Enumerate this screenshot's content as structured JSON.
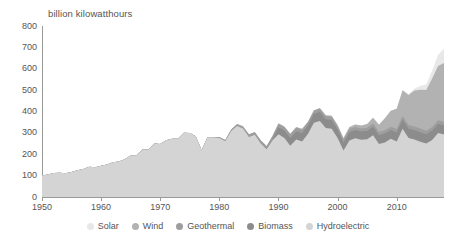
{
  "axis_title": "billion kilowatthours",
  "legend": {
    "items": [
      {
        "label": "Solar",
        "color": "#e8e8e8"
      },
      {
        "label": "Wind",
        "color": "#b2b2b2"
      },
      {
        "label": "Geothermal",
        "color": "#9e9e9e"
      },
      {
        "label": "Biomass",
        "color": "#8c8c8c"
      },
      {
        "label": "Hydroelectric",
        "color": "#d4d4d4"
      }
    ]
  },
  "chart_data": {
    "type": "area",
    "title": "",
    "subtitle": "",
    "xlabel": "",
    "ylabel": "billion kilowatthours",
    "stacked": true,
    "grid": false,
    "legend_position": "bottom",
    "xlim": [
      1950,
      2018
    ],
    "ylim": [
      0,
      800
    ],
    "yticks": [
      0,
      100,
      200,
      300,
      400,
      500,
      600,
      700,
      800
    ],
    "xticks": [
      1950,
      1960,
      1970,
      1980,
      1990,
      2000,
      2010
    ],
    "x": [
      1950,
      1951,
      1952,
      1953,
      1954,
      1955,
      1956,
      1957,
      1958,
      1959,
      1960,
      1961,
      1962,
      1963,
      1964,
      1965,
      1966,
      1967,
      1968,
      1969,
      1970,
      1971,
      1972,
      1973,
      1974,
      1975,
      1976,
      1977,
      1978,
      1979,
      1980,
      1981,
      1982,
      1983,
      1984,
      1985,
      1986,
      1987,
      1988,
      1989,
      1990,
      1991,
      1992,
      1993,
      1994,
      1995,
      1996,
      1997,
      1998,
      1999,
      2000,
      2001,
      2002,
      2003,
      2004,
      2005,
      2006,
      2007,
      2008,
      2009,
      2010,
      2011,
      2012,
      2013,
      2014,
      2015,
      2016,
      2017,
      2018
    ],
    "series": [
      {
        "name": "Hydroelectric",
        "color": "#d4d4d4",
        "values": [
          101,
          105,
          112,
          114,
          111,
          117,
          125,
          131,
          141,
          139,
          146,
          152,
          163,
          166,
          177,
          194,
          195,
          222,
          222,
          250,
          248,
          266,
          273,
          272,
          301,
          300,
          284,
          220,
          280,
          280,
          276,
          261,
          309,
          332,
          321,
          281,
          291,
          250,
          223,
          265,
          293,
          276,
          240,
          269,
          260,
          296,
          347,
          356,
          323,
          319,
          276,
          217,
          264,
          275,
          268,
          270,
          289,
          248,
          255,
          273,
          260,
          319,
          276,
          269,
          259,
          250,
          267,
          300,
          292
        ]
      },
      {
        "name": "Biomass",
        "color": "#8c8c8c",
        "values": [
          0,
          0,
          0,
          0,
          0,
          0,
          0,
          0,
          0,
          0,
          0,
          0,
          0,
          0,
          0,
          0,
          0,
          0,
          0,
          0,
          0,
          0,
          0,
          0,
          0,
          0,
          0,
          0,
          0,
          0,
          0,
          0,
          0,
          0,
          0,
          1,
          2,
          3,
          4,
          5,
          33,
          35,
          36,
          38,
          39,
          40,
          41,
          42,
          41,
          41,
          41,
          38,
          39,
          38,
          38,
          39,
          40,
          41,
          42,
          41,
          42,
          43,
          43,
          44,
          44,
          44,
          44,
          43,
          43
        ]
      },
      {
        "name": "Geothermal",
        "color": "#9e9e9e",
        "values": [
          0,
          0,
          0,
          0,
          0,
          0,
          0,
          0,
          0,
          0,
          0,
          0,
          0,
          0,
          0,
          0,
          0,
          0,
          0,
          0,
          0,
          0,
          0,
          0,
          0,
          0,
          0,
          0,
          0,
          0,
          5,
          6,
          7,
          8,
          9,
          10,
          10,
          11,
          11,
          15,
          16,
          16,
          17,
          17,
          16,
          14,
          15,
          15,
          15,
          15,
          14,
          14,
          15,
          15,
          15,
          15,
          15,
          15,
          15,
          15,
          16,
          17,
          17,
          17,
          17,
          16,
          16,
          16,
          17
        ]
      },
      {
        "name": "Wind",
        "color": "#b2b2b2",
        "values": [
          0,
          0,
          0,
          0,
          0,
          0,
          0,
          0,
          0,
          0,
          0,
          0,
          0,
          0,
          0,
          0,
          0,
          0,
          0,
          0,
          0,
          0,
          0,
          0,
          0,
          0,
          0,
          0,
          0,
          0,
          0,
          0,
          0,
          1,
          1,
          1,
          1,
          1,
          1,
          2,
          3,
          3,
          3,
          3,
          4,
          3,
          3,
          3,
          3,
          5,
          6,
          7,
          10,
          11,
          14,
          18,
          27,
          34,
          56,
          74,
          95,
          120,
          141,
          168,
          182,
          191,
          227,
          254,
          275
        ]
      },
      {
        "name": "Solar",
        "color": "#e8e8e8",
        "values": [
          0,
          0,
          0,
          0,
          0,
          0,
          0,
          0,
          0,
          0,
          0,
          0,
          0,
          0,
          0,
          0,
          0,
          0,
          0,
          0,
          0,
          0,
          0,
          0,
          0,
          0,
          0,
          0,
          0,
          0,
          0,
          0,
          0,
          0,
          0,
          0,
          0,
          0,
          0,
          0,
          0,
          0,
          0,
          0,
          0,
          0,
          0,
          0,
          0,
          0,
          0,
          0,
          0,
          0,
          0,
          0,
          1,
          1,
          1,
          1,
          1,
          2,
          4,
          9,
          18,
          25,
          37,
          53,
          67
        ]
      }
    ]
  }
}
